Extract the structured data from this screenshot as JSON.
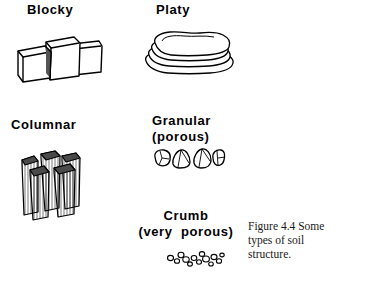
{
  "figure": {
    "background_color": "#ffffff",
    "ink_color": "#000000",
    "caption": "Figure 4.4  Some\ntypes of soil\nstructure.",
    "items": [
      {
        "id": "blocky",
        "label": "Blocky",
        "illustration": "blocky-cubes-illustration"
      },
      {
        "id": "platy",
        "label": "Platy",
        "illustration": "platy-stacked-plates-illustration"
      },
      {
        "id": "columnar",
        "label": "Columnar",
        "illustration": "columnar-prisms-illustration"
      },
      {
        "id": "granular",
        "label_line1": "Granular",
        "label_line2": "(porous)",
        "illustration": "granular-grains-illustration"
      },
      {
        "id": "crumb",
        "label_line1": "Crumb",
        "label_line2": "(very  porous)",
        "illustration": "crumb-specks-illustration"
      }
    ]
  }
}
